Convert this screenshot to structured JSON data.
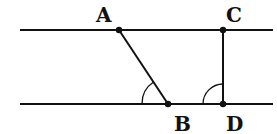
{
  "diagram": {
    "lines": {
      "top": {
        "x1": 20,
        "y1": 30,
        "x2": 273,
        "y2": 30
      },
      "bottom": {
        "x1": 20,
        "y1": 104,
        "x2": 273,
        "y2": 104
      }
    },
    "points": {
      "A": {
        "label": "A",
        "x": 119,
        "y": 30,
        "lx": 96,
        "ly": 22
      },
      "B": {
        "label": "B",
        "x": 168,
        "y": 104,
        "lx": 174,
        "ly": 131
      },
      "C": {
        "label": "C",
        "x": 223,
        "y": 30,
        "lx": 226,
        "ly": 22
      },
      "D": {
        "label": "D",
        "x": 223,
        "y": 104,
        "lx": 226,
        "ly": 131
      }
    },
    "segments": [
      {
        "name": "AB",
        "from": "A",
        "to": "B"
      },
      {
        "name": "CD",
        "from": "C",
        "to": "D"
      }
    ],
    "angle_marks": [
      {
        "name": "angle-ABD-mark",
        "vertex": "B"
      },
      {
        "name": "angle-CDB-mark",
        "vertex": "D"
      }
    ],
    "colors": {
      "stroke": "#111111"
    }
  }
}
